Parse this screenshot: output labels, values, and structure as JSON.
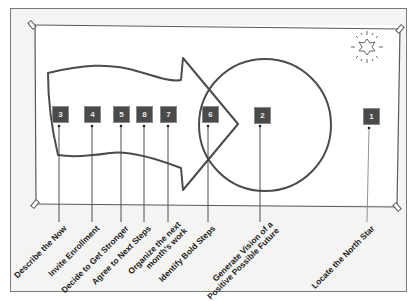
{
  "diagram": {
    "colors": {
      "box_fill": "#4a4a4a",
      "outline": "#4c4c4c",
      "board_line": "#5a5a5a",
      "background": "#f4f4f2"
    },
    "icons": {
      "north_star": "starburst-icon",
      "pins": "pushpin-icon"
    },
    "steps": [
      {
        "number": "3",
        "label": "Describe the Now"
      },
      {
        "number": "4",
        "label": "Invite Enrollment"
      },
      {
        "number": "5",
        "label": "Decide to Get Stronger"
      },
      {
        "number": "8",
        "label": "Agree to Next Steps"
      },
      {
        "number": "7",
        "label": "Organize the next",
        "label2": "month's work"
      },
      {
        "number": "6",
        "label": "Identify Bold Steps"
      },
      {
        "number": "2",
        "label": "Generate Vision of a",
        "label2": "Positive Possible Future"
      },
      {
        "number": "1",
        "label": "Locate the North Star"
      }
    ]
  }
}
